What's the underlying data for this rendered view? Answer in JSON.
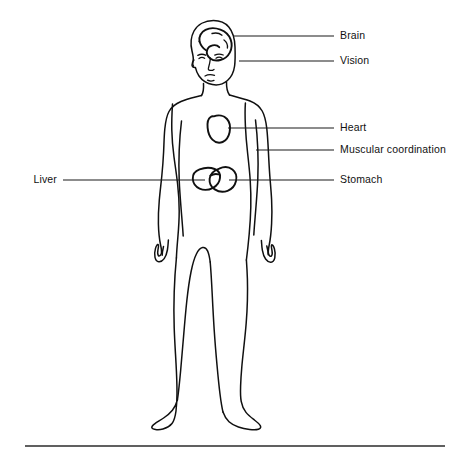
{
  "diagram": {
    "background_color": "#ffffff",
    "line_color": "#101010",
    "label_color": "#111111"
  },
  "callouts": [
    {
      "id": "brain",
      "label": "Brain",
      "side": "right",
      "label_x": 340,
      "label_y": 36,
      "line_x1": 233,
      "line_x2": 334,
      "line_y": 36
    },
    {
      "id": "vision",
      "label": "Vision",
      "side": "right",
      "label_x": 340,
      "label_y": 61,
      "line_x1": 239,
      "line_x2": 334,
      "line_y": 61
    },
    {
      "id": "heart",
      "label": "Heart",
      "side": "right",
      "label_x": 340,
      "label_y": 128,
      "line_x1": 228,
      "line_x2": 334,
      "line_y": 128
    },
    {
      "id": "muscular-coordination",
      "label": "Muscular coordination",
      "side": "right",
      "label_x": 340,
      "label_y": 150,
      "line_x1": 256,
      "line_x2": 334,
      "line_y": 150
    },
    {
      "id": "stomach",
      "label": "Stomach",
      "side": "right",
      "label_x": 340,
      "label_y": 180,
      "line_x1": 229,
      "line_x2": 334,
      "line_y": 180
    },
    {
      "id": "liver",
      "label": "Liver",
      "side": "left",
      "label_x": 57,
      "label_y": 180,
      "line_x1": 63,
      "line_x2": 205,
      "line_y": 180
    }
  ],
  "baseline": {
    "x1": 25,
    "x2": 445,
    "y": 446
  }
}
